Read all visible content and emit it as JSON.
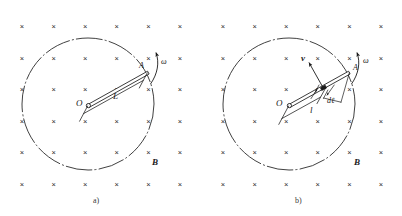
{
  "figure": {
    "type": "physics-diagram",
    "field_marker": "×",
    "field_marker_icon": "cross-into-page-icon",
    "field_grid": {
      "columns": 6,
      "rows": 6
    }
  },
  "panels": [
    {
      "id": "a",
      "caption": "a)",
      "labels": {
        "center": "O",
        "tip": "A",
        "length": "L",
        "omega": "ω",
        "field": "B"
      }
    },
    {
      "id": "b",
      "caption": "b)",
      "labels": {
        "center": "O",
        "tip": "A",
        "velocity": "v",
        "element": "dℓ",
        "length": "l",
        "omega": "ω",
        "field": "B"
      }
    }
  ],
  "colors": {
    "ink": "#1a1a1a",
    "field_marker": "#2b2b2b",
    "background": "#ffffff",
    "caption": "#3a3a3a"
  }
}
